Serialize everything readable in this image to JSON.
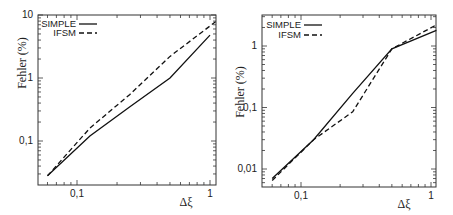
{
  "chart_data": [
    {
      "type": "line",
      "title": "",
      "xlabel": "Δξ",
      "ylabel": "Fehler (%)",
      "xscale": "log",
      "yscale": "log",
      "xlim": [
        0.051,
        1.1
      ],
      "ylim": [
        0.02,
        10
      ],
      "x_ticks": [
        "0,1",
        "1"
      ],
      "y_ticks": [
        "0,1",
        "1",
        "10"
      ],
      "grid": false,
      "legend_position": "upper left",
      "series": [
        {
          "name": "SIMPLE",
          "style": "solid",
          "x": [
            0.06,
            0.125,
            0.25,
            0.5,
            1.0
          ],
          "y": [
            0.028,
            0.12,
            0.35,
            1.0,
            4.8
          ]
        },
        {
          "name": "IFSM",
          "style": "dashed",
          "x": [
            0.06,
            0.125,
            0.25,
            0.5,
            1.1
          ],
          "y": [
            0.028,
            0.16,
            0.55,
            2.2,
            7.8
          ]
        }
      ]
    },
    {
      "type": "line",
      "title": "",
      "xlabel": "Δξ",
      "ylabel": "Fehler (%)",
      "xscale": "log",
      "yscale": "log",
      "xlim": [
        0.05,
        1.1
      ],
      "ylim": [
        0.005,
        3.2
      ],
      "x_ticks": [
        "0,1",
        "1"
      ],
      "y_ticks": [
        "0,01",
        "0,1",
        "1"
      ],
      "grid": false,
      "legend_position": "upper left",
      "series": [
        {
          "name": "SIMPLE",
          "style": "solid",
          "x": [
            0.06,
            0.125,
            0.25,
            0.5,
            1.1
          ],
          "y": [
            0.007,
            0.03,
            0.17,
            0.9,
            1.8
          ]
        },
        {
          "name": "IFSM",
          "style": "dashed",
          "x": [
            0.06,
            0.125,
            0.25,
            0.5,
            1.1
          ],
          "y": [
            0.0065,
            0.03,
            0.085,
            0.9,
            2.2
          ]
        }
      ]
    }
  ],
  "panels": [
    {
      "ylabel": "Fehler (%)",
      "xlabel": "Δξ",
      "legend": [
        "SIMPLE",
        "IFSM"
      ],
      "xticks": [
        "0,1",
        "1"
      ],
      "yticks": [
        "10",
        "1",
        "0,1"
      ]
    },
    {
      "ylabel": "Fehler (%)",
      "xlabel": "Δξ",
      "legend": [
        "SIMPLE",
        "IFSM"
      ],
      "xticks": [
        "0,1",
        "1"
      ],
      "yticks": [
        "1",
        "0,1",
        "0,01"
      ]
    }
  ]
}
